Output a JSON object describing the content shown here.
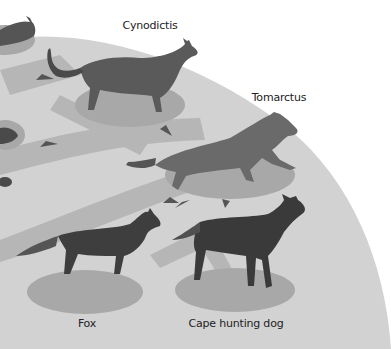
{
  "diagram": {
    "type": "evolutionary-tree",
    "colors": {
      "background": "#ffffff",
      "globe": "#d2d2d2",
      "branch": "#b4b4b4",
      "shadow_ellipse": "#a8a8a8",
      "arrow": "#555555",
      "animal_dark": "#3a3a3a",
      "animal_mid": "#5e5e5e",
      "label": "#222222"
    },
    "nodes": [
      {
        "id": "cynodictis",
        "label": "Cynodictis",
        "label_x": 150,
        "label_y": 19
      },
      {
        "id": "tomarctus",
        "label": "Tomarctus",
        "label_x": 279,
        "label_y": 91
      },
      {
        "id": "fox",
        "label": "Fox",
        "label_x": 87,
        "label_y": 317
      },
      {
        "id": "cape-hunting-dog",
        "label": "Cape hunting dog",
        "label_x": 236,
        "label_y": 317
      }
    ]
  }
}
